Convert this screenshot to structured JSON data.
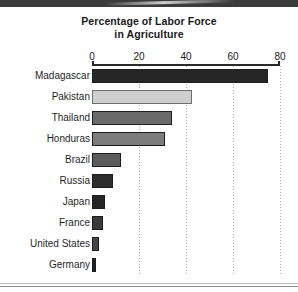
{
  "chart_data": {
    "type": "bar",
    "orientation": "horizontal",
    "title": "Percentage of Labor Force in Agriculture",
    "title_line1": "Percentage of Labor Force",
    "title_line2": "in Agriculture",
    "xlabel": "",
    "ylabel": "",
    "xlim": [
      0,
      80
    ],
    "xticks": [
      0,
      20,
      40,
      60,
      80
    ],
    "xtick_labels": [
      "0",
      "20",
      "40",
      "60",
      "80"
    ],
    "grid": "vertical-dotted",
    "legend": "none",
    "categories": [
      "Madagascar",
      "Pakistan",
      "Thailand",
      "Honduras",
      "Brazil",
      "Russia",
      "Japan",
      "France",
      "United States",
      "Germany"
    ],
    "values": [
      75,
      42.5,
      34,
      31,
      12.5,
      9,
      5.5,
      4.5,
      3,
      1.8
    ],
    "bar_colors": [
      "#262626",
      "#cfcfcf",
      "#6a6a6a",
      "#7c7c7c",
      "#5b5b5b",
      "#2e2e2e",
      "#262626",
      "#3a3a3a",
      "#444444",
      "#222222"
    ]
  },
  "figure": {
    "background": "#ffffff",
    "axis_color": "#2a2a2a",
    "gridline_color": "#b0b0b0",
    "text_color": "#1a1a1a"
  }
}
